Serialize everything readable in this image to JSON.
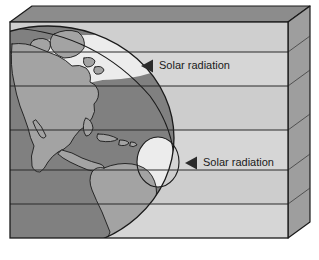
{
  "figure": {
    "type": "schematic-diagram",
    "background_color": "#ffffff"
  },
  "colors": {
    "box_top_face": "#8c8c8c",
    "box_right_face": "#9e9e9e",
    "atmosphere_band": "#d4d4d4",
    "atmosphere_band_alt": "#cdcdcd",
    "globe_ocean": "#808080",
    "globe_land": "#a0a0a0",
    "globe_lit": "#ececec",
    "outline": "#1a1a1a",
    "text": "#1a1a1a",
    "arrow": "#2b2b2b"
  },
  "box": {
    "name": "atmosphere-slab",
    "front_face": {
      "x": 10,
      "y": 22,
      "width": 278,
      "height": 216
    },
    "depth_offset_x": 22,
    "depth_offset_y": -16,
    "band_line_y": [
      52,
      86,
      130,
      170,
      204
    ]
  },
  "globe": {
    "name": "earth-globe",
    "center_x": 48,
    "center_y": 138,
    "radius_x": 126,
    "radius_y": 112,
    "ocean_label": "ocean",
    "land_label": "continents",
    "continents": [
      "North America",
      "Central America",
      "South America",
      "Greenland",
      "Caribbean islands"
    ]
  },
  "lit_regions": [
    {
      "name": "northern-lit-zone",
      "description": "sunlit elliptical crescent over the high northern latitudes",
      "cx": 96,
      "cy": 58,
      "rx": 62,
      "ry": 22,
      "rotation": -14
    },
    {
      "name": "equatorial-lit-bulge",
      "description": "sunlit bulge on the terminator at the equator",
      "cx": 158,
      "cy": 162,
      "rx": 20,
      "ry": 24,
      "rotation": 0
    }
  ],
  "labels": [
    {
      "id": "solar-radiation-upper",
      "text": "Solar radiation",
      "arrow_icon": "left-triangle-arrow-icon",
      "arrow_x": 141,
      "arrow_y": 66,
      "text_x": 159,
      "text_y": 66,
      "band_index": 1
    },
    {
      "id": "solar-radiation-lower",
      "text": "Solar radiation",
      "arrow_icon": "left-triangle-arrow-icon",
      "arrow_x": 185,
      "arrow_y": 163,
      "text_x": 203,
      "text_y": 163,
      "band_index": 3
    }
  ]
}
